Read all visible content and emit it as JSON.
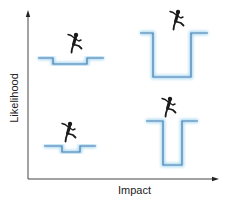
{
  "axes": {
    "x_label": "Impact",
    "y_label": "Likelihood"
  },
  "caption": "(partially cut-off caption text)",
  "colors": {
    "axis": "#444444",
    "pit_stroke": "#4a7fb0",
    "pit_glow": "#a9d8f0",
    "runner": "#1a1a1a"
  },
  "quadrants": [
    {
      "position": "top-left",
      "likelihood": "high",
      "impact": "low",
      "pit": "shallow-wide"
    },
    {
      "position": "top-right",
      "likelihood": "high",
      "impact": "high",
      "pit": "deep-wide"
    },
    {
      "position": "bottom-left",
      "likelihood": "low",
      "impact": "low",
      "pit": "shallow-narrow"
    },
    {
      "position": "bottom-right",
      "likelihood": "low",
      "impact": "high",
      "pit": "deep-narrow"
    }
  ]
}
